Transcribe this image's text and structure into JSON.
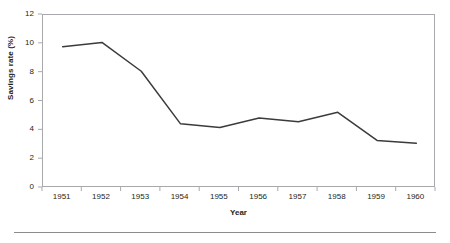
{
  "chart_data": {
    "type": "line",
    "title": "",
    "subtitle": "",
    "xlabel": "Year",
    "ylabel": "Savings rate (%)",
    "categories": [
      "1951",
      "1952",
      "1953",
      "1954",
      "1955",
      "1956",
      "1957",
      "1958",
      "1959",
      "1960"
    ],
    "x": [
      1951,
      1952,
      1953,
      1954,
      1955,
      1956,
      1957,
      1958,
      1959,
      1960
    ],
    "values": [
      9.8,
      10.1,
      8.1,
      4.45,
      4.2,
      4.85,
      4.6,
      5.25,
      3.3,
      3.1
    ],
    "series": [
      {
        "name": "Savings rate",
        "values": [
          9.8,
          10.1,
          8.1,
          4.45,
          4.2,
          4.85,
          4.6,
          5.25,
          3.3,
          3.1
        ]
      }
    ],
    "ylim": [
      0,
      12
    ],
    "yticks": [
      0,
      2,
      4,
      6,
      8,
      10,
      12
    ],
    "ytick_labels": [
      "0",
      "2",
      "4",
      "6",
      "8",
      "10",
      "12"
    ],
    "xtick_labels": [
      "1951",
      "1952",
      "1953",
      "1954",
      "1955",
      "1956",
      "1957",
      "1958",
      "1959",
      "1960"
    ],
    "grid": false,
    "legend": false,
    "legend_position": "none",
    "line_color": "#3b3b3b",
    "frame_color": "#a7a9ac",
    "background_color": "#ffffff",
    "markers": false
  },
  "axes": {
    "y_title": "Savings rate (%)",
    "x_title": "Year"
  },
  "footer": {
    "rule_color": "#8c8c8c"
  }
}
